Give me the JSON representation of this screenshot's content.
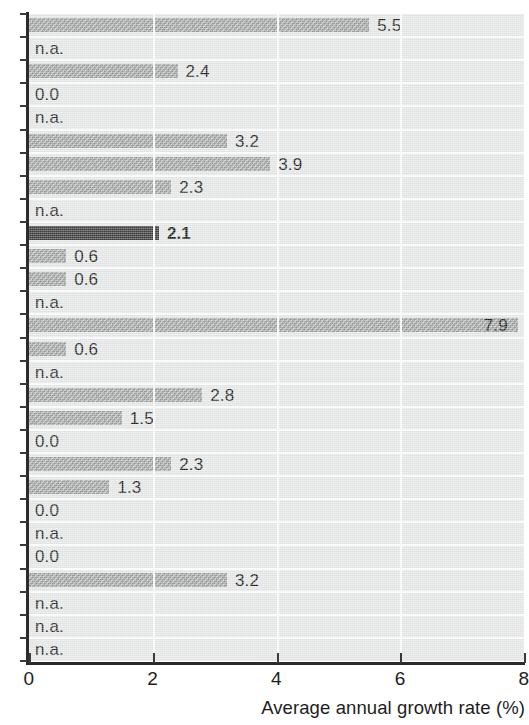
{
  "axis": {
    "x_title": "Average annual growth rate (%)",
    "x_ticks": [
      "0",
      "2",
      "4",
      "6",
      "8"
    ],
    "x_min": 0,
    "x_max": 8
  },
  "labels": {
    "not_available": "n.a."
  },
  "colors": {
    "bar": "#9a9b9b",
    "bar_highlight": "#3d3d3d",
    "plot_background": "#e6e7e7",
    "gridline": "#fbfbfb",
    "axis": "#2b2b2b",
    "text": "#1d1d1d"
  },
  "chart_data": {
    "type": "bar",
    "orientation": "horizontal",
    "title": "",
    "xlabel": "Average annual growth rate (%)",
    "ylabel": "",
    "xlim": [
      0,
      8
    ],
    "xticks": [
      0,
      2,
      4,
      6,
      8
    ],
    "grid": "vertical",
    "legend": "none",
    "missing_marker": "n.a.",
    "highlight_index": 9,
    "categories": [
      "row-1",
      "row-2",
      "row-3",
      "row-4",
      "row-5",
      "row-6",
      "row-7",
      "row-8",
      "row-9",
      "row-10",
      "row-11",
      "row-12",
      "row-13",
      "row-14",
      "row-15",
      "row-16",
      "row-17",
      "row-18",
      "row-19",
      "row-20",
      "row-21",
      "row-22",
      "row-23",
      "row-24",
      "row-25",
      "row-26",
      "row-27",
      "row-28"
    ],
    "values": [
      5.5,
      null,
      2.4,
      0.0,
      null,
      3.2,
      3.9,
      2.3,
      null,
      2.1,
      0.6,
      0.6,
      null,
      7.9,
      0.6,
      null,
      2.8,
      1.5,
      0.0,
      2.3,
      1.3,
      0.0,
      null,
      0.0,
      3.2,
      null,
      null,
      null
    ],
    "labels": [
      "5.5",
      "n.a.",
      "2.4",
      "0.0",
      "n.a.",
      "3.2",
      "3.9",
      "2.3",
      "n.a.",
      "2.1",
      "0.6",
      "0.6",
      "n.a.",
      "7.9",
      "0.6",
      "n.a.",
      "2.8",
      "1.5",
      "0.0",
      "2.3",
      "1.3",
      "0.0",
      "n.a.",
      "0.0",
      "3.2",
      "n.a.",
      "n.a.",
      "n.a."
    ]
  }
}
